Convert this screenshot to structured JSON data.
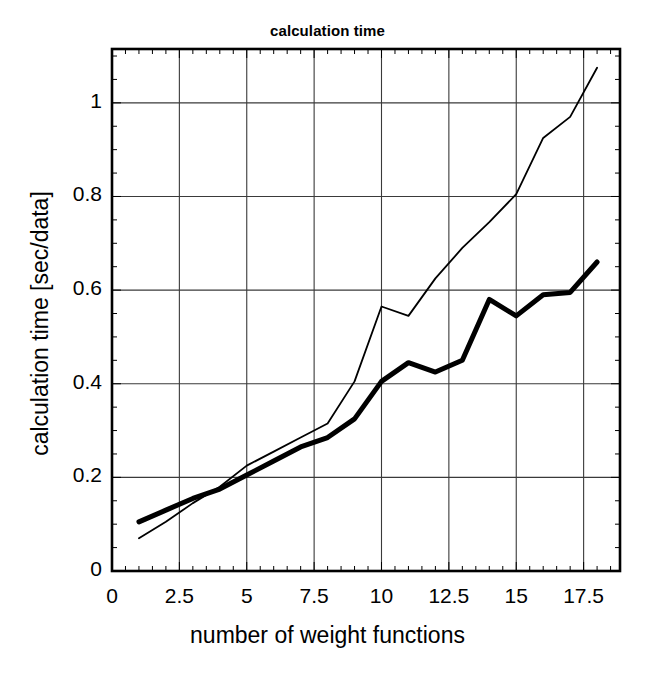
{
  "chart_data": {
    "type": "line",
    "title": "calculation time",
    "xlabel": "number of weight functions",
    "ylabel": "calculation time [sec/data]",
    "xlim": [
      0,
      18.85
    ],
    "ylim": [
      0,
      1.115
    ],
    "grid": true,
    "legend": "none",
    "xticks": [
      "0",
      "2.5",
      "5",
      "7.5",
      "10",
      "12.5",
      "15",
      "17.5"
    ],
    "xtick_values": [
      0,
      2.5,
      5,
      7.5,
      10,
      12.5,
      15,
      17.5
    ],
    "yticks": [
      "0",
      "0.2",
      "0.4",
      "0.6",
      "0.8",
      "1"
    ],
    "ytick_values": [
      0,
      0.2,
      0.4,
      0.6,
      0.8,
      1.0
    ],
    "x": [
      1,
      2,
      3,
      4,
      5,
      6,
      7,
      8,
      9,
      10,
      11,
      12,
      13,
      14,
      15,
      16,
      17,
      18
    ],
    "series": [
      {
        "name": "thick-curve",
        "style": "thick-solid",
        "color": "#000000",
        "linewidth": 5,
        "values": [
          0.105,
          0.13,
          0.155,
          0.175,
          0.205,
          0.235,
          0.265,
          0.285,
          0.325,
          0.405,
          0.445,
          0.425,
          0.45,
          0.58,
          0.545,
          0.59,
          0.595,
          0.66
        ]
      },
      {
        "name": "thin-curve",
        "style": "thin-solid",
        "color": "#000000",
        "linewidth": 1.8,
        "values": [
          0.07,
          0.105,
          0.145,
          0.18,
          0.225,
          0.255,
          0.285,
          0.315,
          0.405,
          0.565,
          0.545,
          0.625,
          0.69,
          0.745,
          0.805,
          0.925,
          0.97,
          1.075
        ]
      }
    ]
  }
}
